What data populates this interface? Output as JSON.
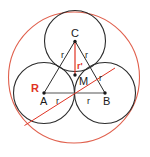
{
  "figure": {
    "background_color": "#ffffff",
    "colors": {
      "outer_circle": "#e0604d",
      "small_circles": "#2b2b2b",
      "triangle": "#2b2b2b",
      "radius_red": "#e03323",
      "label_dark": "#1a1a1a",
      "label_red": "#e03323",
      "baseline": "#555555"
    },
    "outer_circle": {
      "name": "circumscribed-circle",
      "cx": 74,
      "cy": 77.5,
      "r": 65.5,
      "stroke": "#e0604d"
    },
    "small_circles": [
      {
        "name": "circle-C",
        "label": "C",
        "cx": 75,
        "cy": 41,
        "r": 30.5
      },
      {
        "name": "circle-A",
        "label": "A",
        "cx": 44,
        "cy": 93,
        "r": 30.5
      },
      {
        "name": "circle-B",
        "label": "B",
        "cx": 105,
        "cy": 93,
        "r": 30.5
      }
    ],
    "triangle": {
      "name": "triangle-ABC",
      "vertices": [
        {
          "label": "A",
          "x": 44,
          "y": 93
        },
        {
          "label": "B",
          "x": 105,
          "y": 93
        },
        {
          "label": "C",
          "x": 75,
          "cy": 41,
          "y": 41
        }
      ]
    },
    "centroid": {
      "name": "centroid-M",
      "label": "M",
      "x": 75,
      "y": 75
    },
    "red_radius_line": {
      "name": "outer-radius-R",
      "from_x": 25,
      "from_y": 125,
      "to_x": 115,
      "to_y": 68
    },
    "inradius_line": {
      "name": "inradius-r-prime",
      "from_x": 75,
      "from_y": 41,
      "to_x": 75,
      "to_y": 75
    },
    "baseline": {
      "name": "segment-AB",
      "x1": 44,
      "y1": 93,
      "x2": 105,
      "y2": 93
    }
  },
  "labels": {
    "vertex_c": "C",
    "vertex_a": "A",
    "vertex_b": "B",
    "centroid_m": "M",
    "side_r_left_upper": "r",
    "side_r_right_upper": "r",
    "side_r_right_lower": "r",
    "side_r_base_left": "r",
    "side_r_base_right": "r",
    "big_radius_R": "R",
    "inradius_r_prime": "r'"
  }
}
